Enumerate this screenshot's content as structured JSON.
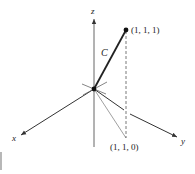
{
  "diagram": {
    "type": "3d-coordinate-axes-with-curve",
    "axes": {
      "x": {
        "label": "x"
      },
      "y": {
        "label": "y"
      },
      "z": {
        "label": "z"
      }
    },
    "curve": {
      "label": "C",
      "from": "origin",
      "to": "(1, 1, 1)"
    },
    "points": [
      {
        "name": "end-point",
        "label": "(1, 1, 1)"
      },
      {
        "name": "projection-point",
        "label": "(1, 1, 0)"
      }
    ],
    "colors": {
      "line": "#333333",
      "background": "#ffffff"
    }
  }
}
